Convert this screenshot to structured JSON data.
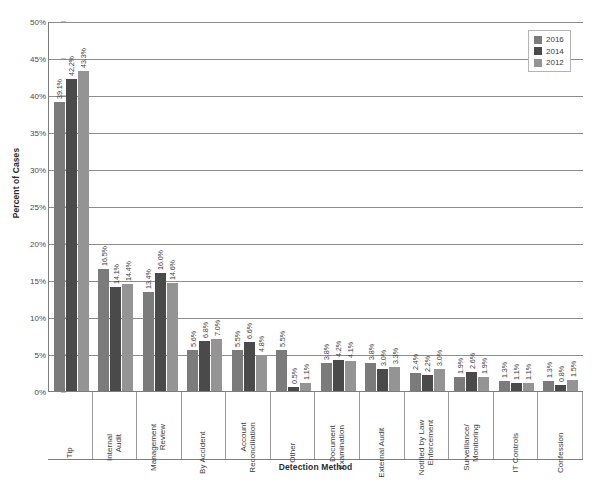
{
  "chart_data": {
    "type": "bar",
    "title": "",
    "xlabel": "Detection Method",
    "ylabel": "Percent of Cases",
    "ylim": [
      0,
      50
    ],
    "ytick_labels": [
      "50%",
      "45%",
      "40%",
      "35%",
      "30%",
      "25%",
      "20%",
      "15%",
      "10%",
      "5%",
      "0%"
    ],
    "ytick_values": [
      50,
      45,
      40,
      35,
      30,
      25,
      20,
      15,
      10,
      5,
      0
    ],
    "grid": true,
    "legend_position": "top-right",
    "categories": [
      "Tip",
      "Internal Audit",
      "Management Review",
      "By Accident",
      "Account Reconciliation",
      "Other",
      "Document Examination",
      "External Audit",
      "Notified by Law Enforcement",
      "Surveillance/ Monitoring",
      "IT Controls",
      "Confession"
    ],
    "category_label_lines": [
      [
        "Tip"
      ],
      [
        "Internal",
        "Audit"
      ],
      [
        "Management",
        "Review"
      ],
      [
        "By Accident"
      ],
      [
        "Account",
        "Reconciliation"
      ],
      [
        "Other"
      ],
      [
        "Document",
        "Examination"
      ],
      [
        "External Audit"
      ],
      [
        "Notified by Law",
        "Enforcement"
      ],
      [
        "Surveillance/",
        "Monitoring"
      ],
      [
        "IT Controls"
      ],
      [
        "Confession"
      ]
    ],
    "series": [
      {
        "name": "2016",
        "color": "#7b7b7b",
        "values": [
          39.1,
          16.5,
          13.4,
          5.6,
          5.5,
          5.5,
          3.8,
          3.8,
          2.4,
          1.9,
          1.3,
          1.3
        ],
        "labels": [
          "39.1%",
          "16.5%",
          "13.4%",
          "5.6%",
          "5.5%",
          "5.5%",
          "3.8%",
          "3.8%",
          "2.4%",
          "1.9%",
          "1.3%",
          "1.3%"
        ]
      },
      {
        "name": "2014",
        "color": "#4a4a4a",
        "values": [
          42.2,
          14.1,
          16.0,
          6.8,
          6.6,
          0.5,
          4.2,
          3.0,
          2.2,
          2.6,
          1.1,
          0.8
        ],
        "labels": [
          "42.2%",
          "14.1%",
          "16.0%",
          "6.8%",
          "6.6%",
          "0.5%",
          "4.2%",
          "3.0%",
          "2.2%",
          "2.6%",
          "1.1%",
          "0.8%"
        ]
      },
      {
        "name": "2012",
        "color": "#949494",
        "values": [
          43.3,
          14.4,
          14.6,
          7.0,
          4.8,
          1.1,
          4.1,
          3.3,
          3.0,
          1.9,
          1.1,
          1.5
        ],
        "labels": [
          "43.3%",
          "14.4%",
          "14.6%",
          "7.0%",
          "4.8%",
          "1.1%",
          "4.1%",
          "3.3%",
          "3.0%",
          "1.9%",
          "1.1%",
          "1.5%"
        ]
      }
    ]
  },
  "legend": {
    "items": [
      {
        "label": "2016",
        "color": "#7b7b7b"
      },
      {
        "label": "2014",
        "color": "#4a4a4a"
      },
      {
        "label": "2012",
        "color": "#949494"
      }
    ]
  },
  "axes": {
    "y_title": "Percent of Cases",
    "x_title": "Detection Method"
  }
}
